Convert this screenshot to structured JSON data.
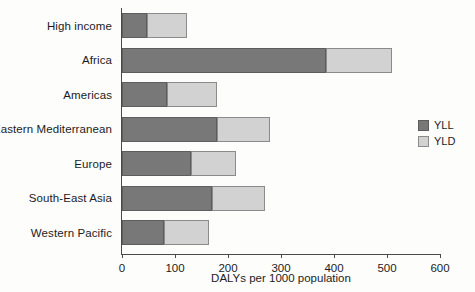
{
  "chart_data": {
    "type": "bar",
    "orientation": "horizontal",
    "stacked": true,
    "title": "",
    "xlabel": "DALYs per 1000 population",
    "ylabel": "",
    "xlim": [
      0,
      600
    ],
    "xticks": [
      0,
      100,
      200,
      300,
      400,
      500,
      600
    ],
    "xtick_labels": [
      "0",
      "100",
      "200",
      "300",
      "400",
      "500",
      "600"
    ],
    "grid": false,
    "legend_position": "right",
    "categories": [
      "High income",
      "Africa",
      "Americas",
      "Eastern Mediterranean",
      "Europe",
      "South-East Asia",
      "Western Pacific"
    ],
    "series": [
      {
        "name": "YLL",
        "color": "#787878",
        "values": [
          47,
          385,
          85,
          180,
          130,
          170,
          80
        ]
      },
      {
        "name": "YLD",
        "color": "#d2d2d2",
        "values": [
          75,
          125,
          95,
          100,
          85,
          100,
          85
        ]
      }
    ],
    "totals": [
      122,
      510,
      180,
      280,
      215,
      270,
      165
    ]
  },
  "legend": {
    "entries": [
      {
        "label": "YLL",
        "swatch": "yll"
      },
      {
        "label": "YLD",
        "swatch": "yld"
      }
    ]
  },
  "colors": {
    "yll": "#787878",
    "yld": "#d2d2d2",
    "axis": "#4a4a4a",
    "background": "#fdfdfc",
    "text": "#1c1c1c"
  }
}
